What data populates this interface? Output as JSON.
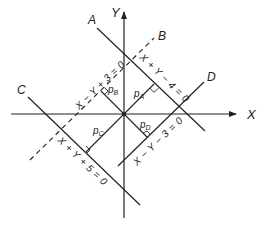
{
  "figure": {
    "axes": {
      "x_label": "X",
      "y_label": "Y",
      "origin_px": [
        124,
        114
      ],
      "scale_px_per_unit": 15.2
    },
    "lines": [
      {
        "id": "A",
        "label": "A",
        "equation": "X + Y − 4 = 0",
        "style": "solid"
      },
      {
        "id": "B",
        "label": "B",
        "equation": "X − Y + 3 = 0",
        "style": "dashed"
      },
      {
        "id": "C",
        "label": "C",
        "equation": "X + Y + 5 = 0",
        "style": "solid"
      },
      {
        "id": "D",
        "label": "D",
        "equation": "X − Y − 3 = 0",
        "style": "solid"
      }
    ],
    "perpendiculars": [
      {
        "id": "pA",
        "base": "p",
        "sub": "A",
        "to_line": "A",
        "foot": [
          2,
          2
        ]
      },
      {
        "id": "pB",
        "base": "p",
        "sub": "B",
        "to_line": "B",
        "foot": [
          -1.5,
          1.5
        ]
      },
      {
        "id": "pC",
        "base": "p",
        "sub": "C",
        "to_line": "C",
        "foot": [
          -2.5,
          -2.5
        ]
      },
      {
        "id": "pD",
        "base": "p",
        "sub": "D",
        "to_line": "D",
        "foot": [
          1.5,
          -1.5
        ]
      }
    ],
    "colors": {
      "ink": "#222222",
      "background": "#ffffff"
    }
  }
}
